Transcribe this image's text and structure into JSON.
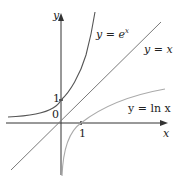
{
  "diagram": {
    "axes": {
      "x_label": "x",
      "y_label": "y",
      "origin_label": "0",
      "x_tick_label": "1",
      "y_tick_label": "1"
    },
    "curves": [
      {
        "name": "exp",
        "label": "y = e",
        "label_sup": "x",
        "color": "#555555"
      },
      {
        "name": "identity",
        "label": "y = x",
        "color": "#777777"
      },
      {
        "name": "ln",
        "label": "y = ln x",
        "color": "#aaaaaa"
      }
    ]
  }
}
